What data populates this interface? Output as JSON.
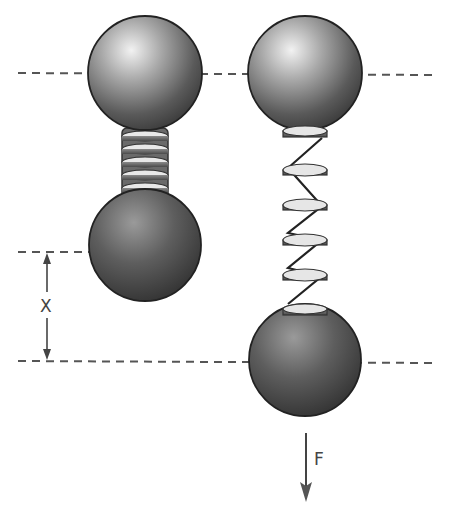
{
  "diagram": {
    "labels": {
      "displacement": "X",
      "force": "F"
    },
    "colors": {
      "ball_dark": "#2e2e2e",
      "ball_light": "#d9d9d9",
      "disc_face": "#e6e6e6",
      "disc_edge": "#555555",
      "line": "#444444",
      "dash": "#555555",
      "background": "#ffffff"
    },
    "left_assembly": {
      "state": "compressed",
      "coil_count": 6
    },
    "right_assembly": {
      "state": "stretched",
      "coil_count": 6
    }
  }
}
